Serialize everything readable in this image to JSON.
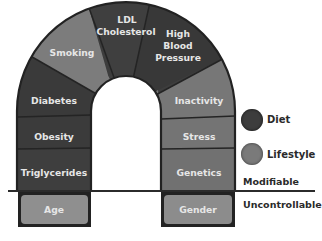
{
  "diagram": {
    "type": "arch",
    "segments": [
      {
        "id": "diabetes",
        "label": "Diabetes",
        "category": "diet"
      },
      {
        "id": "smoking",
        "label": "Smoking",
        "category": "lifestyle"
      },
      {
        "id": "ldl",
        "label_lines": [
          "LDL",
          "Cholesterol"
        ],
        "category": "diet"
      },
      {
        "id": "hbp",
        "label_lines": [
          "High",
          "Blood",
          "Pressure"
        ],
        "category": "diet"
      },
      {
        "id": "inactivity",
        "label": "Inactivity",
        "category": "lifestyle"
      },
      {
        "id": "obesity",
        "label": "Obesity",
        "category": "diet"
      },
      {
        "id": "stress",
        "label": "Stress",
        "category": "lifestyle"
      },
      {
        "id": "triglycerides",
        "label": "Triglycerides",
        "category": "diet"
      },
      {
        "id": "genetics",
        "label": "Genetics",
        "category": "lifestyle"
      },
      {
        "id": "age",
        "label": "Age",
        "category": "uncontrollable"
      },
      {
        "id": "gender",
        "label": "Gender",
        "category": "uncontrollable"
      }
    ],
    "labels": {
      "diabetes": "Diabetes",
      "smoking": "Smoking",
      "ldl_1": "LDL",
      "ldl_2": "Cholesterol",
      "hbp_1": "High",
      "hbp_2": "Blood",
      "hbp_3": "Pressure",
      "inactivity": "Inactivity",
      "obesity": "Obesity",
      "stress": "Stress",
      "triglycerides": "Triglycerides",
      "genetics": "Genetics",
      "age": "Age",
      "gender": "Gender"
    }
  },
  "legend": {
    "diet": {
      "label": "Diet",
      "color": "#3d3d3d"
    },
    "lifestyle": {
      "label": "Lifestyle",
      "color": "#7a7a7a"
    }
  },
  "zones": {
    "modifiable": "Modifiable",
    "uncontrollable": "Uncontrollable"
  },
  "colors": {
    "diet": "#3d3d3d",
    "lifestyle": "#727272",
    "uncontrollable": "#8e8e8e",
    "outline": "#222222"
  }
}
